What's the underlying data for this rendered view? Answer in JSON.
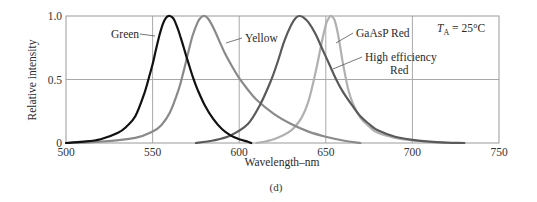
{
  "chart_data": {
    "type": "line",
    "title": "",
    "caption": "(d)",
    "xlabel": "Wavelength–nm",
    "ylabel": "Relative intensity",
    "xlim": [
      500,
      750
    ],
    "ylim": [
      0,
      1.0
    ],
    "xticks": [
      500,
      550,
      600,
      650,
      700,
      750
    ],
    "xtick_labels": [
      "500",
      "550",
      "600",
      "650",
      "700",
      "750"
    ],
    "yticks": [
      0,
      0.5,
      1.0
    ],
    "ytick_labels": [
      "0",
      "0.5",
      "1.0"
    ],
    "grid": true,
    "annotation": {
      "text_T": "T",
      "text_sub": "A",
      "text_rest": " = 25°C"
    },
    "series": [
      {
        "name": "Green",
        "color": "#111111",
        "width": 2.2,
        "label_lines": [
          "Green"
        ],
        "x": [
          500,
          510,
          520,
          530,
          535,
          540,
          545,
          548,
          550,
          552,
          554,
          556,
          558,
          560,
          562,
          564,
          566,
          568,
          570,
          573,
          576,
          580,
          585,
          590,
          595,
          600,
          605,
          607
        ],
        "y": [
          0.0,
          0.01,
          0.03,
          0.08,
          0.13,
          0.21,
          0.38,
          0.52,
          0.62,
          0.74,
          0.85,
          0.94,
          0.99,
          1.0,
          0.98,
          0.92,
          0.84,
          0.75,
          0.66,
          0.53,
          0.42,
          0.3,
          0.19,
          0.11,
          0.06,
          0.03,
          0.01,
          0.0
        ]
      },
      {
        "name": "Yellow",
        "color": "#8a8a8a",
        "width": 2.2,
        "label_lines": [
          "Yellow"
        ],
        "x": [
          500,
          520,
          540,
          550,
          555,
          560,
          565,
          568,
          570,
          573,
          576,
          578,
          580,
          582,
          585,
          588,
          592,
          596,
          600,
          605,
          610,
          620,
          630,
          640,
          650,
          660,
          670
        ],
        "y": [
          0.0,
          0.01,
          0.04,
          0.09,
          0.14,
          0.24,
          0.42,
          0.57,
          0.68,
          0.84,
          0.95,
          0.99,
          1.0,
          0.98,
          0.91,
          0.82,
          0.7,
          0.6,
          0.51,
          0.42,
          0.34,
          0.23,
          0.15,
          0.09,
          0.05,
          0.02,
          0.0
        ]
      },
      {
        "name": "High efficiency Red",
        "color": "#5a5a5a",
        "width": 2.2,
        "label_lines": [
          "High efficiency",
          "Red"
        ],
        "x": [
          575,
          585,
          595,
          605,
          612,
          618,
          622,
          626,
          630,
          633,
          635,
          637,
          640,
          644,
          648,
          652,
          656,
          660,
          665,
          670,
          675,
          680,
          690,
          700,
          710,
          720,
          730
        ],
        "y": [
          0.0,
          0.02,
          0.06,
          0.15,
          0.3,
          0.48,
          0.63,
          0.8,
          0.93,
          0.99,
          1.0,
          0.99,
          0.95,
          0.86,
          0.74,
          0.62,
          0.5,
          0.4,
          0.3,
          0.21,
          0.15,
          0.1,
          0.05,
          0.025,
          0.01,
          0.003,
          0.0
        ]
      },
      {
        "name": "GaAsP Red",
        "color": "#b0b0b0",
        "width": 2.2,
        "label_lines": [
          "GaAsP Red"
        ],
        "x": [
          610,
          620,
          630,
          636,
          640,
          644,
          647,
          650,
          652,
          653,
          655,
          657,
          660,
          663,
          666,
          670,
          675,
          680,
          690,
          700,
          710,
          720
        ],
        "y": [
          0.0,
          0.03,
          0.1,
          0.2,
          0.33,
          0.55,
          0.75,
          0.93,
          0.99,
          1.0,
          0.97,
          0.86,
          0.62,
          0.42,
          0.3,
          0.2,
          0.13,
          0.08,
          0.04,
          0.02,
          0.008,
          0.0
        ]
      }
    ]
  }
}
